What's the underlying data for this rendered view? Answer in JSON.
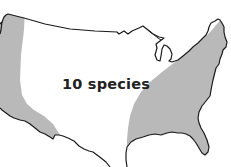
{
  "map": {
    "region": "Contiguous United States",
    "label": "10 species",
    "colors": {
      "background": "#ffffff",
      "shaded_range": "#b9b9b9",
      "outline": "#1a1a1a",
      "label": "#222222"
    },
    "legend": {
      "shaded_meaning": "range areas",
      "shaded_regions": [
        "western coastal range",
        "eastern range"
      ]
    }
  }
}
